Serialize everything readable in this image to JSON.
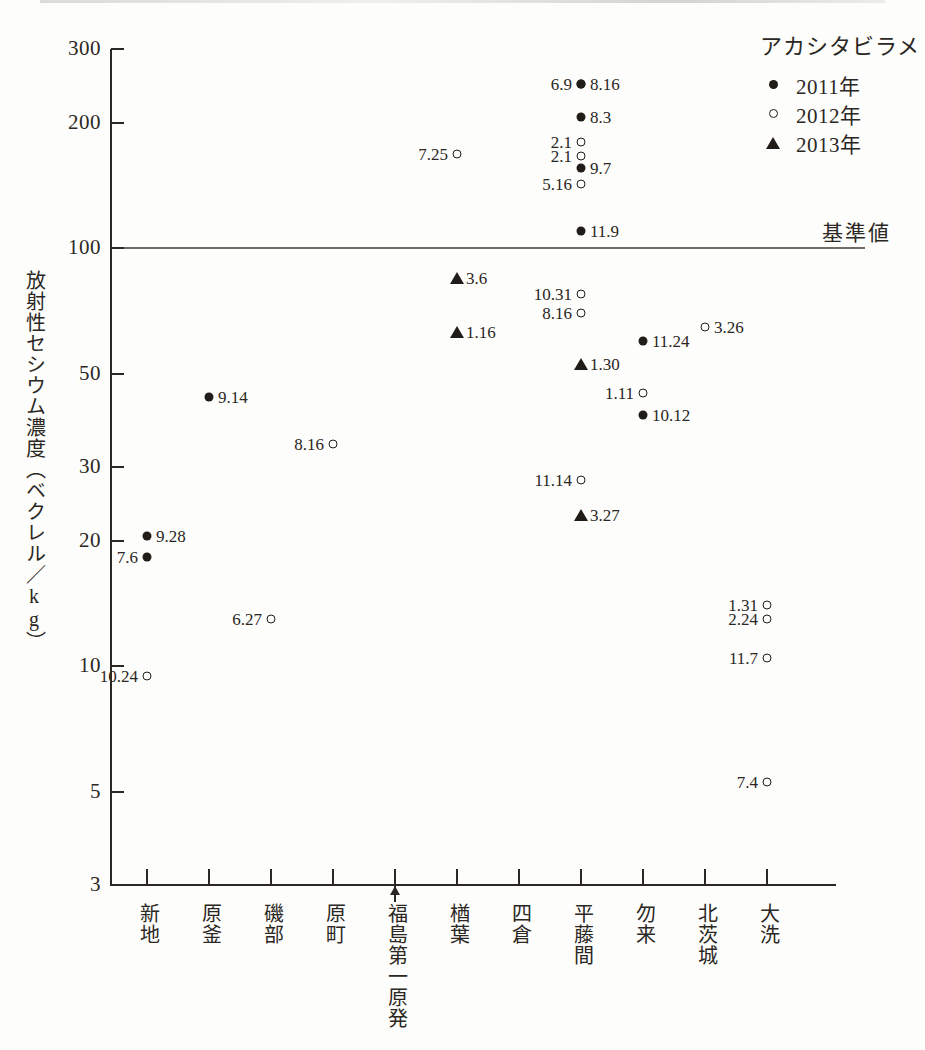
{
  "figure": {
    "y_axis_title": "放射性セシウム濃度（ベクレル／kg）",
    "reference_label": "基準値",
    "reference_value": 100
  },
  "legend": {
    "title": "アカシタビラメ",
    "entries": [
      {
        "marker": "filled-circle",
        "label": "2011年"
      },
      {
        "marker": "open-circle",
        "label": "2012年"
      },
      {
        "marker": "filled-triangle",
        "label": "2013年"
      }
    ]
  },
  "chart_data": {
    "type": "scatter",
    "title": "",
    "xlabel": "",
    "ylabel": "放射性セシウム濃度（ベクレル／kg）",
    "yscale": "log",
    "ylim": [
      3,
      300
    ],
    "yticks": [
      300,
      200,
      100,
      50,
      30,
      20,
      10,
      5,
      3
    ],
    "ytick_labels": [
      "300",
      "200",
      "100",
      "50",
      "30",
      "20",
      "10",
      "5",
      "3"
    ],
    "grid": false,
    "legend_position": "top-right",
    "categories": [
      "新地",
      "原釜",
      "磯部",
      "原町",
      "福島第一原発",
      "楢葉",
      "四倉",
      "平藤間",
      "勿来",
      "北茨城",
      "大洗"
    ],
    "annotations": [
      {
        "text": "基準値",
        "y": 100,
        "kind": "reference-line-label"
      },
      {
        "text": "福島第一原発",
        "kind": "x-axis-arrow-marker"
      }
    ],
    "series": [
      {
        "name": "2011年",
        "marker": "filled-circle",
        "points": [
          {
            "category": "新地",
            "label": "9.28",
            "value": 20.5,
            "label_side": "right"
          },
          {
            "category": "新地",
            "label": "7.6",
            "value": 18.3,
            "label_side": "left"
          },
          {
            "category": "原釜",
            "label": "9.14",
            "value": 44,
            "label_side": "right"
          },
          {
            "category": "平藤間",
            "label": "8.16",
            "value": 248,
            "label_side": "right"
          },
          {
            "category": "平藤間",
            "label": "6.9",
            "value": 248,
            "label_side": "left"
          },
          {
            "category": "平藤間",
            "label": "8.3",
            "value": 206,
            "label_side": "right"
          },
          {
            "category": "平藤間",
            "label": "9.7",
            "value": 156,
            "label_side": "right"
          },
          {
            "category": "平藤間",
            "label": "11.9",
            "value": 110,
            "label_side": "right"
          },
          {
            "category": "勿来",
            "label": "11.24",
            "value": 60,
            "label_side": "right"
          },
          {
            "category": "勿来",
            "label": "10.12",
            "value": 40,
            "label_side": "right"
          }
        ]
      },
      {
        "name": "2012年",
        "marker": "open-circle",
        "points": [
          {
            "category": "新地",
            "label": "10.24",
            "value": 9.5,
            "label_side": "left"
          },
          {
            "category": "磯部",
            "label": "6.27",
            "value": 13,
            "label_side": "left"
          },
          {
            "category": "原町",
            "label": "8.16",
            "value": 34,
            "label_side": "left"
          },
          {
            "category": "楢葉",
            "label": "7.25",
            "value": 168,
            "label_side": "left"
          },
          {
            "category": "平藤間",
            "label": "2.1",
            "value": 180,
            "label_side": "left"
          },
          {
            "category": "平藤間",
            "label": "2.1",
            "value": 166,
            "label_side": "left"
          },
          {
            "category": "平藤間",
            "label": "5.16",
            "value": 143,
            "label_side": "left"
          },
          {
            "category": "平藤間",
            "label": "10.31",
            "value": 78,
            "label_side": "left"
          },
          {
            "category": "平藤間",
            "label": "8.16",
            "value": 70,
            "label_side": "left"
          },
          {
            "category": "平藤間",
            "label": "11.14",
            "value": 28,
            "label_side": "left"
          },
          {
            "category": "勿来",
            "label": "1.11",
            "value": 45,
            "label_side": "left"
          },
          {
            "category": "北茨城",
            "label": "3.26",
            "value": 65,
            "label_side": "right"
          },
          {
            "category": "大洗",
            "label": "1.31",
            "value": 14,
            "label_side": "left"
          },
          {
            "category": "大洗",
            "label": "2.24",
            "value": 13,
            "label_side": "left"
          },
          {
            "category": "大洗",
            "label": "11.7",
            "value": 10.5,
            "label_side": "left"
          },
          {
            "category": "大洗",
            "label": "7.4",
            "value": 5.3,
            "label_side": "left"
          }
        ]
      },
      {
        "name": "2013年",
        "marker": "filled-triangle",
        "points": [
          {
            "category": "楢葉",
            "label": "3.6",
            "value": 85,
            "label_side": "right"
          },
          {
            "category": "楢葉",
            "label": "1.16",
            "value": 63,
            "label_side": "right"
          },
          {
            "category": "平藤間",
            "label": "1.30",
            "value": 53,
            "label_side": "right"
          },
          {
            "category": "平藤間",
            "label": "3.27",
            "value": 23,
            "label_side": "right"
          }
        ]
      }
    ]
  }
}
